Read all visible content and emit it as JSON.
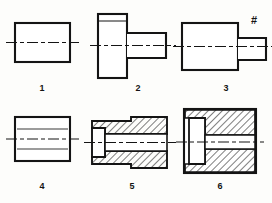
{
  "sheet": {
    "title": "Orthographic and sectional views of six machine parts",
    "background_color": "#fdfdfb",
    "line_color": "#141414",
    "hatch_color": "#141414",
    "width": 272,
    "height": 203
  },
  "figures": [
    {
      "id": "figure-1",
      "label": "1",
      "type": "outline-view",
      "description": "Plain rectangular block front view with horizontal centerline",
      "hatched": false
    },
    {
      "id": "figure-2",
      "label": "2",
      "type": "outline-view",
      "description": "Tall flanged block with smaller rectangular boss projecting right, horizontal centerline",
      "hatched": false
    },
    {
      "id": "figure-3",
      "label": "3",
      "type": "outline-view",
      "description": "Large rectangular block with smaller stepped boss projecting right, horizontal centerline",
      "hatched": false
    },
    {
      "id": "figure-4",
      "label": "4",
      "type": "outline-view-hidden",
      "description": "Rectangular block with two hidden dashed lines and horizontal centerline",
      "hatched": false
    },
    {
      "id": "figure-5",
      "label": "5",
      "type": "section-view",
      "description": "Full section of stepped sleeve, cross hatched walls, unhatched bore and left counterbore",
      "hatched": true
    },
    {
      "id": "figure-6",
      "label": "6",
      "type": "section-view",
      "description": "Full section of square flanged bushing, cross hatched body, unhatched counterbore at left and central bore",
      "hatched": true
    }
  ],
  "annotations": [
    {
      "id": "hash-mark-figure-3",
      "symbol": "#",
      "attached_to": "figure-3"
    }
  ],
  "labels": {
    "one": "1",
    "two": "2",
    "three": "3",
    "four": "4",
    "five": "5",
    "six": "6"
  }
}
